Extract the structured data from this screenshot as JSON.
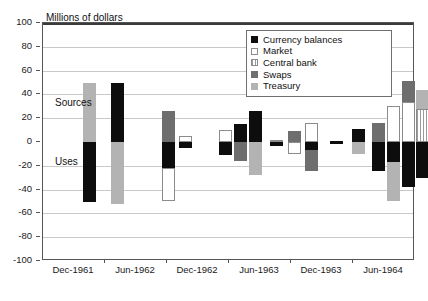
{
  "chart_data": {
    "type": "bar",
    "title": "Millions of dollars",
    "xlabel": "",
    "ylabel": "Millions of dollars",
    "ylim": [
      -100,
      100
    ],
    "ytick_values": [
      100,
      80,
      60,
      40,
      20,
      0,
      -20,
      -40,
      -60,
      -80,
      -100
    ],
    "ytick_labels": [
      "100",
      "80",
      "60",
      "40",
      "20",
      "0",
      "-20",
      "-40",
      "-60",
      "-80",
      "-100"
    ],
    "grid": true,
    "grid_axis": "y",
    "legend_position": "top-right",
    "categories": [
      "Dec-1961",
      "Jun-1962",
      "Dec-1962",
      "Jun-1963",
      "Dec-1963",
      "Jun-1964"
    ],
    "xtick_labels": [
      "Dec-1961",
      "Jun-1962",
      "Dec-1962",
      "Jun-1963",
      "Dec-1963",
      "Jun-1964"
    ],
    "annotations": [
      {
        "text": "Sources",
        "value_region": "positive"
      },
      {
        "text": "Uses",
        "value_region": "negative"
      }
    ],
    "series": [
      {
        "name": "Currency balances",
        "color": "#0d0d0d",
        "swatch": "solid-black"
      },
      {
        "name": "Market",
        "color": "#ffffff",
        "swatch": "open-white"
      },
      {
        "name": "Central bank",
        "color": "#cccccc",
        "swatch": "hatched"
      },
      {
        "name": "Swaps",
        "color": "#6e6e6e",
        "swatch": "solid-dark-gray"
      },
      {
        "name": "Treasury",
        "color": "#b3b3b3",
        "swatch": "solid-light-gray"
      }
    ],
    "bars": [
      {
        "x_px": 88,
        "series": "Treasury",
        "value": 50,
        "period": "Jun-1962"
      },
      {
        "x_px": 88,
        "series": "Currency balances",
        "value": -50,
        "period": "Jun-1962"
      },
      {
        "x_px": 116,
        "series": "Currency balances",
        "value": 50,
        "period": "Jun-1962"
      },
      {
        "x_px": 116,
        "series": "Treasury",
        "value": -52,
        "period": "Jun-1962"
      },
      {
        "x_px": 167,
        "series": "Swaps",
        "value": 26,
        "period": "Dec-1962"
      },
      {
        "x_px": 167,
        "series": "Currency balances",
        "value": -22,
        "period": "Dec-1962"
      },
      {
        "x_px": 167,
        "series": "Market",
        "value": -28,
        "period": "Dec-1962"
      },
      {
        "x_px": 184,
        "series": "Market",
        "value": 5,
        "period": "Dec-1962"
      },
      {
        "x_px": 184,
        "series": "Currency balances",
        "value": -5,
        "period": "Dec-1962"
      },
      {
        "x_px": 224,
        "series": "Market",
        "value": 10,
        "period": "Jun-1963"
      },
      {
        "x_px": 224,
        "series": "Currency balances",
        "value": -11,
        "period": "Jun-1963"
      },
      {
        "x_px": 239,
        "series": "Currency balances",
        "value": 15,
        "period": "Jun-1963"
      },
      {
        "x_px": 239,
        "series": "Swaps",
        "value": -16,
        "period": "Jun-1963"
      },
      {
        "x_px": 254,
        "series": "Currency balances",
        "value": 26,
        "period": "Jun-1963"
      },
      {
        "x_px": 254,
        "series": "Treasury",
        "value": -28,
        "period": "Jun-1963"
      },
      {
        "x_px": 275,
        "series": "Market",
        "value": 2,
        "period": "Jun-1963"
      },
      {
        "x_px": 275,
        "series": "Currency balances",
        "value": -3,
        "period": "Jun-1963"
      },
      {
        "x_px": 293,
        "series": "Swaps",
        "value": 9,
        "period": "Dec-1963"
      },
      {
        "x_px": 293,
        "series": "Market",
        "value": -10,
        "period": "Dec-1963"
      },
      {
        "x_px": 310,
        "series": "Market",
        "value": 16,
        "period": "Dec-1963"
      },
      {
        "x_px": 310,
        "series": "Currency balances",
        "value": -7,
        "period": "Dec-1963"
      },
      {
        "x_px": 310,
        "series": "Swaps",
        "value": -17,
        "period": "Dec-1963"
      },
      {
        "x_px": 335,
        "series": "Currency balances",
        "value": 1,
        "period": "Dec-1963"
      },
      {
        "x_px": 335,
        "series": "Currency balances",
        "value": -2,
        "period": "Dec-1963"
      },
      {
        "x_px": 357,
        "series": "Currency balances",
        "value": 11,
        "period": "Jun-1964"
      },
      {
        "x_px": 357,
        "series": "Treasury",
        "value": -10,
        "period": "Jun-1964"
      },
      {
        "x_px": 377,
        "series": "Swaps",
        "value": 16,
        "period": "Jun-1964"
      },
      {
        "x_px": 377,
        "series": "Currency balances",
        "value": -24,
        "period": "Jun-1964"
      },
      {
        "x_px": 392,
        "series": "Market",
        "value": 30,
        "period": "Jun-1964"
      },
      {
        "x_px": 392,
        "series": "Currency balances",
        "value": -17,
        "period": "Jun-1964"
      },
      {
        "x_px": 392,
        "series": "Treasury",
        "value": -33,
        "period": "Jun-1964"
      },
      {
        "x_px": 407,
        "series": "Market",
        "value": 34,
        "period": "Jun-1964"
      },
      {
        "x_px": 407,
        "series": "Swaps",
        "value": 17,
        "period": "Jun-1964"
      },
      {
        "x_px": 407,
        "series": "Currency balances",
        "value": -38,
        "period": "Jun-1964"
      },
      {
        "x_px": 421,
        "series": "Central bank",
        "value": 28,
        "period": "Jun-1964"
      },
      {
        "x_px": 421,
        "series": "Treasury",
        "value": 16,
        "period": "Jun-1964"
      },
      {
        "x_px": 421,
        "series": "Currency balances",
        "value": -30,
        "period": "Jun-1964"
      }
    ]
  },
  "legend": {
    "items": [
      {
        "label": "Currency balances",
        "swatch_class": "sw-currency"
      },
      {
        "label": "Market",
        "swatch_class": "sw-market"
      },
      {
        "label": "Central bank",
        "swatch_class": "sw-central"
      },
      {
        "label": "Swaps",
        "swatch_class": "sw-swaps"
      },
      {
        "label": "Treasury",
        "swatch_class": "sw-treasury"
      }
    ]
  }
}
